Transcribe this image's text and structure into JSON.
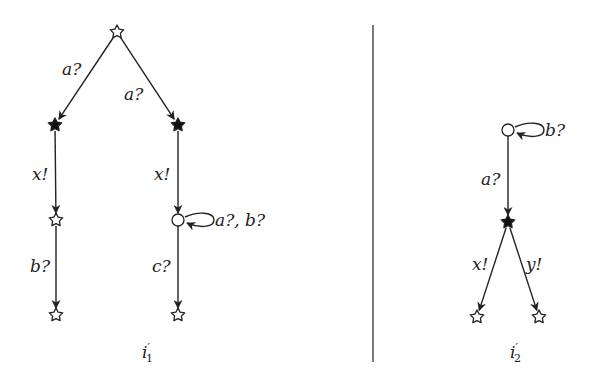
{
  "diagram": {
    "type": "labelled transition systems",
    "separator": {
      "x": 373,
      "y1": 25,
      "y2": 362
    },
    "graphs": [
      {
        "name": "i1",
        "caption": {
          "base": "i",
          "prime": "′",
          "sub": "1",
          "x": 142,
          "y": 358
        },
        "nodes": [
          {
            "id": "r",
            "shape": "star-open",
            "x": 117,
            "y": 32
          },
          {
            "id": "l1",
            "shape": "star-filled",
            "x": 55,
            "y": 125
          },
          {
            "id": "r1",
            "shape": "star-filled",
            "x": 178,
            "y": 125
          },
          {
            "id": "l2",
            "shape": "star-open",
            "x": 56,
            "y": 220
          },
          {
            "id": "r2",
            "shape": "circle",
            "x": 178,
            "y": 220
          },
          {
            "id": "l3",
            "shape": "star-open",
            "x": 56,
            "y": 315
          },
          {
            "id": "r3",
            "shape": "star-open",
            "x": 178,
            "y": 315
          }
        ],
        "edges": [
          {
            "from": "r",
            "to": "l1",
            "label": "a?",
            "lx": 62,
            "ly": 75
          },
          {
            "from": "r",
            "to": "r1",
            "label": "a?",
            "lx": 124,
            "ly": 100
          },
          {
            "from": "l1",
            "to": "l2",
            "label": "x!",
            "lx": 32,
            "ly": 180
          },
          {
            "from": "r1",
            "to": "r2",
            "label": "x!",
            "lx": 154,
            "ly": 180
          },
          {
            "from": "l2",
            "to": "l3",
            "label": "b?",
            "lx": 30,
            "ly": 272
          },
          {
            "from": "r2",
            "to": "r3",
            "label": "c?",
            "lx": 152,
            "ly": 272
          },
          {
            "from": "r2",
            "to": "r2",
            "label": "a?, b?",
            "lx": 215,
            "ly": 226,
            "self": true
          }
        ]
      },
      {
        "name": "i2",
        "caption": {
          "base": "i",
          "prime": "′",
          "sub": "2",
          "x": 510,
          "y": 358
        },
        "nodes": [
          {
            "id": "c",
            "shape": "circle",
            "x": 508,
            "y": 130
          },
          {
            "id": "s",
            "shape": "star-filled",
            "x": 508,
            "y": 222
          },
          {
            "id": "bl",
            "shape": "star-open",
            "x": 477,
            "y": 317
          },
          {
            "id": "br",
            "shape": "star-open",
            "x": 539,
            "y": 317
          }
        ],
        "edges": [
          {
            "from": "c",
            "to": "c",
            "label": "b?",
            "lx": 545,
            "ly": 136,
            "self": true
          },
          {
            "from": "c",
            "to": "s",
            "label": "a?",
            "lx": 481,
            "ly": 185
          },
          {
            "from": "s",
            "to": "bl",
            "label": "x!",
            "lx": 472,
            "ly": 270
          },
          {
            "from": "s",
            "to": "br",
            "label": "y!",
            "lx": 526,
            "ly": 270
          }
        ]
      }
    ]
  }
}
